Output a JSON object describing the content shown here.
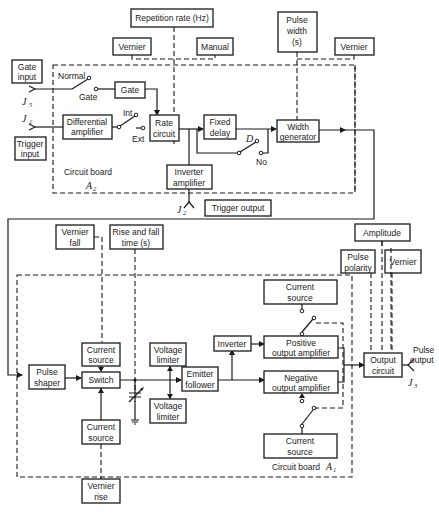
{
  "controls": {
    "repetition_rate": "Repetition rate (Hz)",
    "rep_vernier": "Vernier",
    "rep_manual": "Manual",
    "pulse_width": [
      "Pulse",
      "width",
      "(s)"
    ],
    "width_vernier": "Vernier",
    "gate_input": [
      "Gate",
      "input"
    ],
    "trigger_input": [
      "Trigger",
      "input"
    ],
    "trigger_output": "Trigger output",
    "vernier_fall": [
      "Vernier",
      "fall"
    ],
    "rise_fall_time": [
      "Rise and fall",
      "time  (s)"
    ],
    "vernier_rise": [
      "Vernier",
      "rise"
    ],
    "amplitude": "Amplitude",
    "pulse_polarity": [
      "Pulse",
      "polarity"
    ],
    "out_vernier": "Vernier",
    "pulse_output": [
      "Pulse",
      "output"
    ]
  },
  "board_a2": {
    "label": "Circuit board",
    "id": "A",
    "sub": "2",
    "blocks": {
      "gate": "Gate",
      "differential_amplifier": [
        "Differential",
        "amplifier"
      ],
      "rate_circuit": [
        "Rate",
        "circuit"
      ],
      "fixed_delay": [
        "Fixed",
        "delay"
      ],
      "width_generator": [
        "Width",
        "generator"
      ],
      "inverter_amplifier": [
        "Inverter",
        "amplifier"
      ]
    },
    "switch_labels": {
      "normal": "Normal",
      "gate": "Gate",
      "int": "Int",
      "ext": "Ext",
      "d": "D",
      "no": "No"
    }
  },
  "board_a1": {
    "label": "Circuit board",
    "id": "A",
    "sub": "1",
    "blocks": {
      "pulse_shaper": [
        "Pulse",
        "shaper"
      ],
      "current_source_top": [
        "Current",
        "source"
      ],
      "switch": "Switch",
      "current_source_bottom": [
        "Current",
        "source"
      ],
      "voltage_limiter_top": [
        "Voltage",
        "limiter"
      ],
      "voltage_limiter_bottom": [
        "Voltage",
        "limiter"
      ],
      "emitter_follower": [
        "Emitter",
        "follower"
      ],
      "inverter": "Inverter",
      "current_source_pos": [
        "Current",
        "source"
      ],
      "positive_output_amplifier": [
        "Positive",
        "output amplifier"
      ],
      "negative_output_amplifier": [
        "Negative",
        "output amplifier"
      ],
      "current_source_neg": [
        "Current",
        "source"
      ],
      "output_circuit": [
        "Output",
        "circuit"
      ]
    }
  },
  "connectors": {
    "j5": {
      "letter": "J",
      "sub": "5"
    },
    "j1": {
      "letter": "J",
      "sub": "1"
    },
    "j2": {
      "letter": "J",
      "sub": "2"
    },
    "j3": {
      "letter": "J",
      "sub": "3"
    }
  }
}
